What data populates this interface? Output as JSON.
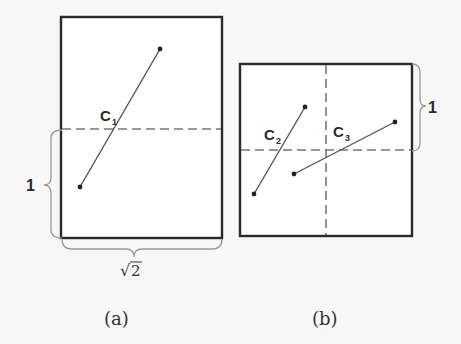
{
  "figure": {
    "panels": [
      {
        "id": "a",
        "caption": "(a)",
        "frame": {
          "x": 61,
          "y": 17,
          "width": 161,
          "height": 221
        },
        "width_label": "√2",
        "height_label": "1",
        "dashed_lines": [
          {
            "orientation": "horizontal",
            "y": 129
          }
        ],
        "segments": [
          {
            "name": "C",
            "subscript": "1",
            "x1": 160,
            "y1": 49,
            "x2": 80,
            "y2": 187
          }
        ]
      },
      {
        "id": "b",
        "caption": "(b)",
        "frame": {
          "x": 240,
          "y": 64,
          "width": 172,
          "height": 172
        },
        "height_label": "1",
        "dashed_lines": [
          {
            "orientation": "horizontal",
            "y": 150
          },
          {
            "orientation": "vertical",
            "x": 326
          }
        ],
        "segments": [
          {
            "name": "C",
            "subscript": "2",
            "x1": 305,
            "y1": 107,
            "x2": 254,
            "y2": 194
          },
          {
            "name": "C",
            "subscript": "3",
            "x1": 395,
            "y1": 122,
            "x2": 294,
            "y2": 174
          }
        ]
      }
    ],
    "labels": {
      "c1_main": "C",
      "c1_sub": "1",
      "c2_main": "C",
      "c2_sub": "2",
      "c3_main": "C",
      "c3_sub": "3",
      "a_height": "1",
      "a_width_radical": "√",
      "a_width_value": "2",
      "b_height": "1",
      "caption_a": "(a)",
      "caption_b": "(b)"
    },
    "colors": {
      "frame": "#2a2a2a",
      "dash": "#777777",
      "segment": "#555555",
      "brace": "#9a9a9a",
      "background": "#f7f7f7"
    }
  }
}
